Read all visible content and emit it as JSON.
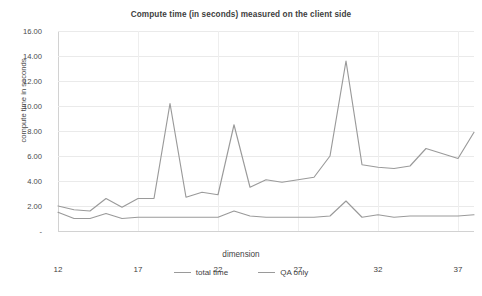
{
  "chart_data": {
    "type": "line",
    "title": "Compute time (in seconds) measured on the client side",
    "xlabel": "dimension",
    "ylabel": "compute time in seconds",
    "xlim": [
      12,
      38
    ],
    "ylim": [
      0,
      16
    ],
    "grid": true,
    "legend_position": "bottom",
    "y_ticks": [
      "16.00",
      "14.00",
      "12.00",
      "10.00",
      "8.00",
      "6.00",
      "4.00",
      "2.00",
      "-"
    ],
    "y_tick_values": [
      16,
      14,
      12,
      10,
      8,
      6,
      4,
      2,
      0
    ],
    "x_ticks": [
      "12",
      "17",
      "22",
      "27",
      "32",
      "37"
    ],
    "x_tick_values": [
      12,
      17,
      22,
      27,
      32,
      37
    ],
    "x": [
      12,
      13,
      14,
      15,
      16,
      17,
      18,
      19,
      20,
      21,
      22,
      23,
      24,
      25,
      26,
      27,
      28,
      29,
      30,
      31,
      32,
      33,
      34,
      35,
      36,
      37,
      38
    ],
    "series": [
      {
        "name": "total time",
        "color": "#9a9a9a",
        "values": [
          2.0,
          1.7,
          1.6,
          2.6,
          1.9,
          2.6,
          2.6,
          10.2,
          2.7,
          3.1,
          2.9,
          8.5,
          3.5,
          4.1,
          3.9,
          4.1,
          4.3,
          6.0,
          13.6,
          5.3,
          5.1,
          5.0,
          5.2,
          6.6,
          6.2,
          5.8,
          7.9
        ]
      },
      {
        "name": "QA only",
        "color": "#9a9a9a",
        "values": [
          1.5,
          1.0,
          1.0,
          1.4,
          1.0,
          1.1,
          1.1,
          1.1,
          1.1,
          1.1,
          1.1,
          1.6,
          1.2,
          1.1,
          1.1,
          1.1,
          1.1,
          1.2,
          2.4,
          1.1,
          1.3,
          1.1,
          1.2,
          1.2,
          1.2,
          1.2,
          1.3
        ]
      }
    ]
  },
  "colors": {
    "background": "#ffffff",
    "grid": "#eaeaea",
    "axis": "#d2d2d2",
    "text": "#3f3f3f",
    "line": "#9a9a9a"
  }
}
